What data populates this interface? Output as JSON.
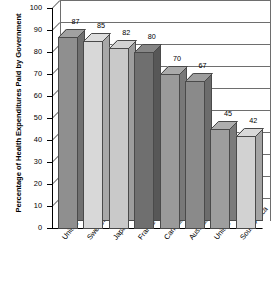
{
  "chart_data": {
    "type": "bar",
    "title": "",
    "xlabel": "",
    "ylabel": "Percentage of Health Expenditures Paid by Government",
    "ylim": [
      0,
      100
    ],
    "ytick_step": 10,
    "yticks": [
      "100",
      "90",
      "80",
      "70",
      "60",
      "50",
      "40",
      "30",
      "20",
      "10",
      "0"
    ],
    "grid": true,
    "legend": "none",
    "style": "3d-column",
    "categories": [
      "United Kingdom",
      "Sweden",
      "Japan",
      "France",
      "Canada",
      "Australia",
      "United States",
      "South Africa"
    ],
    "values": [
      87,
      85,
      82,
      80,
      70,
      67,
      45,
      42
    ],
    "value_labels": [
      "87",
      "85",
      "82",
      "80",
      "70",
      "67",
      "45",
      "42"
    ],
    "bar_colors": [
      "#8f8f8f",
      "#d8d8d8",
      "#c9c9c9",
      "#6f6f6f",
      "#9a9a9a",
      "#8a8a8a",
      "#9e9e9e",
      "#d2d2d2"
    ],
    "colors": {
      "axis": "#000000",
      "grid": "#6e6e6e",
      "background": "#ffffff",
      "bar_outline": "#4a4a4a"
    }
  }
}
